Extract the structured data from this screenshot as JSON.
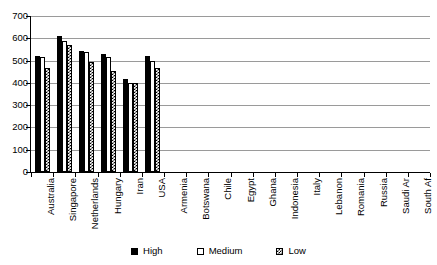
{
  "chart_data": {
    "type": "bar",
    "title": "",
    "subtitle": "",
    "xlabel": "",
    "ylabel": "",
    "ylim": [
      0,
      700
    ],
    "ytick_step": 100,
    "yticks": [
      700,
      600,
      500,
      400,
      300,
      200,
      100,
      0
    ],
    "ytick_labels": [
      "700",
      "600",
      "500",
      "400",
      "300",
      "200",
      "100",
      "0"
    ],
    "grid": true,
    "grid_axis": "y",
    "legend_position": "bottom",
    "orientation": "vertical",
    "categories": [
      "Australia",
      "Singapore",
      "Netherlands",
      "Hungary",
      "Iran",
      "USA",
      "Armenia",
      "Botswana",
      "Chile",
      "Egypt",
      "Ghana",
      "Indonesia",
      "Italy",
      "Lebanon",
      "Romania",
      "Russia",
      "Saudi Ar",
      "South Af"
    ],
    "series": [
      {
        "name": "High",
        "pattern": "solid-black",
        "color": "#000000",
        "values": [
          520,
          610,
          543,
          530,
          418,
          522,
          null,
          null,
          null,
          null,
          null,
          null,
          null,
          null,
          null,
          null,
          null,
          null
        ]
      },
      {
        "name": "Medium",
        "pattern": "hollow-white",
        "color": "#ffffff",
        "values": [
          515,
          587,
          540,
          516,
          400,
          500,
          null,
          null,
          null,
          null,
          null,
          null,
          null,
          null,
          null,
          null,
          null,
          null
        ]
      },
      {
        "name": "Low",
        "pattern": "checkered",
        "color": "#000000",
        "values": [
          468,
          572,
          494,
          452,
          398,
          466,
          null,
          null,
          null,
          null,
          null,
          null,
          null,
          null,
          null,
          null,
          null,
          null
        ]
      }
    ]
  },
  "legend": {
    "entries": [
      {
        "label": "High",
        "swatch": "solid-black-swatch"
      },
      {
        "label": "Medium",
        "swatch": "hollow-white-swatch"
      },
      {
        "label": "Low",
        "swatch": "checkered-swatch"
      }
    ]
  }
}
